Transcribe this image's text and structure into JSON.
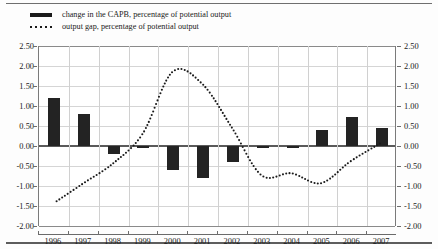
{
  "legend": {
    "items": [
      {
        "key": "solid-bar-key",
        "label": "change in the CAPB, percentage of potential output"
      },
      {
        "key": "dotted-line-key",
        "label": "output gap, percentage of potential output"
      }
    ]
  },
  "axis": {
    "y_ticks": [
      "2.50",
      "2.00",
      "1.50",
      "1.00",
      "0.50",
      "0.00",
      "-0.50",
      "-1.00",
      "-1.50",
      "-2.00"
    ],
    "x_ticks": [
      "1996",
      "1997",
      "1998",
      "1999",
      "2000",
      "2001",
      "2002",
      "2003",
      "2004",
      "2005",
      "2006",
      "2007"
    ]
  },
  "colors": {
    "bar": "#232323",
    "line": "#1a1a1a",
    "grid": "#d5d5d5",
    "axis": "#6d6d6d",
    "background": "#ffffff"
  },
  "chart_data": {
    "type": "bar",
    "title": "",
    "xlabel": "",
    "ylabel": "",
    "ylim": [
      -2.0,
      2.5
    ],
    "ytick_step": 0.5,
    "grid": true,
    "legend_position": "top-left",
    "categories": [
      "1996",
      "1997",
      "1998",
      "1999",
      "2000",
      "2001",
      "2002",
      "2003",
      "2004",
      "2005",
      "2006",
      "2007"
    ],
    "series": [
      {
        "name": "change in the CAPB, percentage of potential output",
        "type": "bar",
        "values": [
          1.2,
          0.8,
          -0.2,
          -0.03,
          -0.6,
          -0.8,
          -0.4,
          -0.05,
          -0.05,
          0.4,
          0.72,
          0.46
        ]
      },
      {
        "name": "output gap, percentage of potential output",
        "type": "line",
        "style": "dotted",
        "values": [
          -1.45,
          -0.95,
          -0.45,
          0.3,
          1.85,
          1.55,
          0.45,
          -0.75,
          -0.7,
          -0.95,
          -0.4,
          0.05
        ]
      }
    ]
  }
}
